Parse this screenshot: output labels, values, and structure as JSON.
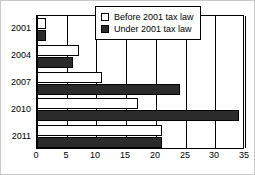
{
  "chart_data": {
    "type": "bar",
    "orientation": "horizontal",
    "title": "",
    "xlabel": "",
    "ylabel": "",
    "categories": [
      "2001",
      "2004",
      "2007",
      "2010",
      "2011"
    ],
    "series": [
      {
        "name": "Before 2001 tax law",
        "color": "#ffffff",
        "values": [
          1.5,
          7,
          11,
          17,
          21
        ]
      },
      {
        "name": "Under 2001 tax law",
        "color": "#2b2b2b",
        "values": [
          1.5,
          6,
          24,
          34,
          21
        ]
      }
    ],
    "xlim": [
      0,
      35
    ],
    "xticks": [
      0,
      5,
      10,
      15,
      20,
      25,
      30,
      35
    ],
    "xtick_labels": [
      "0",
      "5",
      "10",
      "15",
      "20",
      "25",
      "30",
      "35"
    ],
    "grid": "vertical",
    "legend_position": "top-right-inside"
  },
  "legend": {
    "entries": [
      {
        "label": "Before 2001 tax law",
        "swatch": "open-square-swatch"
      },
      {
        "label": "Under 2001 tax law",
        "swatch": "filled-square-swatch"
      }
    ]
  }
}
